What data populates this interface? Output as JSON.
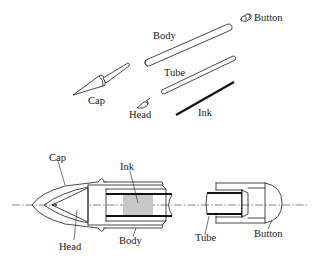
{
  "figure": {
    "exploded_view": {
      "labels": {
        "body": "Body",
        "button": "Button",
        "tube": "Tube",
        "cap": "Cap",
        "head": "Head",
        "ink": "Ink"
      }
    },
    "assembled_section": {
      "labels": {
        "cap": "Cap",
        "ink": "Ink",
        "head": "Head",
        "body": "Body",
        "tube": "Tube",
        "button": "Button"
      },
      "ink_fill_color": "#c8c8c8"
    }
  }
}
